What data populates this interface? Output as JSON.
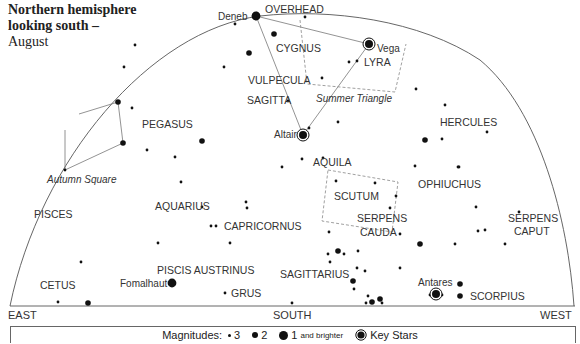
{
  "title": {
    "line1": "Northern hemisphere",
    "line2": "looking south –",
    "line3": "August"
  },
  "horizon": {
    "east": "EAST",
    "south": "SOUTH",
    "west": "WEST"
  },
  "overhead_label": "OVERHEAD",
  "constellations": [
    {
      "name": "CYGNUS",
      "x": 276,
      "y": 52
    },
    {
      "name": "LYRA",
      "x": 364,
      "y": 66
    },
    {
      "name": "VULPECULA",
      "x": 248,
      "y": 84
    },
    {
      "name": "SAGITTA",
      "x": 247,
      "y": 104
    },
    {
      "name": "PEGASUS",
      "x": 142,
      "y": 128
    },
    {
      "name": "HERCULES",
      "x": 440,
      "y": 126
    },
    {
      "name": "AQUILA",
      "x": 313,
      "y": 166
    },
    {
      "name": "OPHIUCHUS",
      "x": 418,
      "y": 188
    },
    {
      "name": "SCUTUM",
      "x": 334,
      "y": 200
    },
    {
      "name": "AQUARIUS",
      "x": 155,
      "y": 210
    },
    {
      "name": "SERPENS",
      "x": 357,
      "y": 222
    },
    {
      "name": "CAUDA",
      "x": 360,
      "y": 236
    },
    {
      "name": "SERPENS",
      "x": 508,
      "y": 222
    },
    {
      "name": "CAPUT",
      "x": 514,
      "y": 235
    },
    {
      "name": "PISCES",
      "x": 34,
      "y": 218
    },
    {
      "name": "CAPRICORNUS",
      "x": 224,
      "y": 230
    },
    {
      "name": "SAGITTARIUS",
      "x": 280,
      "y": 278
    },
    {
      "name": "PISCIS AUSTRINUS",
      "x": 157,
      "y": 274
    },
    {
      "name": "CETUS",
      "x": 40,
      "y": 289
    },
    {
      "name": "GRUS",
      "x": 231,
      "y": 297
    },
    {
      "name": "SCORPIUS",
      "x": 470,
      "y": 300
    }
  ],
  "asterisms": [
    {
      "name": "Summer Triangle",
      "x": 316,
      "y": 102
    },
    {
      "name": "Autumn Square",
      "x": 47,
      "y": 183
    }
  ],
  "key_stars": [
    {
      "name": "Deneb",
      "x": 256,
      "y": 16,
      "label_x": 218,
      "label_y": 20
    },
    {
      "name": "Vega",
      "x": 369,
      "y": 44,
      "label_x": 377,
      "label_y": 52
    },
    {
      "name": "Altair",
      "x": 303,
      "y": 135,
      "label_x": 274,
      "label_y": 138
    },
    {
      "name": "Antares",
      "x": 436,
      "y": 294,
      "label_x": 418,
      "label_y": 286
    },
    {
      "name": "Fomalhaut",
      "x": 172,
      "y": 283,
      "label_x": 120,
      "label_y": 287
    }
  ],
  "stars": [
    {
      "x": 256,
      "y": 16,
      "m": 1
    },
    {
      "x": 235,
      "y": 24,
      "m": 3
    },
    {
      "x": 305,
      "y": 17,
      "m": 3
    },
    {
      "x": 274,
      "y": 34,
      "m": 2
    },
    {
      "x": 249,
      "y": 53,
      "m": 2
    },
    {
      "x": 224,
      "y": 67,
      "m": 3
    },
    {
      "x": 349,
      "y": 62,
      "m": 3
    },
    {
      "x": 357,
      "y": 61,
      "m": 3
    },
    {
      "x": 322,
      "y": 78,
      "m": 3
    },
    {
      "x": 416,
      "y": 89,
      "m": 3
    },
    {
      "x": 288,
      "y": 101,
      "m": 3
    },
    {
      "x": 309,
      "y": 128,
      "m": 3
    },
    {
      "x": 338,
      "y": 122,
      "m": 3
    },
    {
      "x": 135,
      "y": 45,
      "m": 3
    },
    {
      "x": 124,
      "y": 67,
      "m": 3
    },
    {
      "x": 118,
      "y": 102,
      "m": 2
    },
    {
      "x": 132,
      "y": 108,
      "m": 3
    },
    {
      "x": 123,
      "y": 143,
      "m": 2
    },
    {
      "x": 147,
      "y": 150,
      "m": 3
    },
    {
      "x": 175,
      "y": 157,
      "m": 3
    },
    {
      "x": 65,
      "y": 170,
      "m": 3
    },
    {
      "x": 202,
      "y": 141,
      "m": 2
    },
    {
      "x": 181,
      "y": 182,
      "m": 3
    },
    {
      "x": 202,
      "y": 207,
      "m": 3
    },
    {
      "x": 216,
      "y": 226,
      "m": 3
    },
    {
      "x": 211,
      "y": 226,
      "m": 3
    },
    {
      "x": 158,
      "y": 243,
      "m": 3
    },
    {
      "x": 230,
      "y": 243,
      "m": 3
    },
    {
      "x": 81,
      "y": 262,
      "m": 3
    },
    {
      "x": 225,
      "y": 293,
      "m": 3
    },
    {
      "x": 58,
      "y": 302,
      "m": 3
    },
    {
      "x": 88,
      "y": 303,
      "m": 2
    },
    {
      "x": 292,
      "y": 303,
      "m": 3
    },
    {
      "x": 323,
      "y": 158,
      "m": 3
    },
    {
      "x": 302,
      "y": 159,
      "m": 3
    },
    {
      "x": 282,
      "y": 167,
      "m": 3
    },
    {
      "x": 246,
      "y": 202,
      "m": 3
    },
    {
      "x": 247,
      "y": 208,
      "m": 3
    },
    {
      "x": 336,
      "y": 181,
      "m": 3
    },
    {
      "x": 375,
      "y": 183,
      "m": 3
    },
    {
      "x": 390,
      "y": 208,
      "m": 3
    },
    {
      "x": 396,
      "y": 196,
      "m": 3
    },
    {
      "x": 415,
      "y": 166,
      "m": 3
    },
    {
      "x": 459,
      "y": 167,
      "m": 3
    },
    {
      "x": 445,
      "y": 105,
      "m": 3
    },
    {
      "x": 442,
      "y": 139,
      "m": 3
    },
    {
      "x": 487,
      "y": 132,
      "m": 3
    },
    {
      "x": 425,
      "y": 140,
      "m": 2
    },
    {
      "x": 458,
      "y": 167,
      "m": 3
    },
    {
      "x": 476,
      "y": 207,
      "m": 3
    },
    {
      "x": 519,
      "y": 212,
      "m": 3
    },
    {
      "x": 478,
      "y": 231,
      "m": 3
    },
    {
      "x": 485,
      "y": 230,
      "m": 3
    },
    {
      "x": 455,
      "y": 244,
      "m": 3
    },
    {
      "x": 505,
      "y": 244,
      "m": 3
    },
    {
      "x": 420,
      "y": 244,
      "m": 2
    },
    {
      "x": 400,
      "y": 234,
      "m": 3
    },
    {
      "x": 329,
      "y": 232,
      "m": 3
    },
    {
      "x": 338,
      "y": 251,
      "m": 2
    },
    {
      "x": 328,
      "y": 254,
      "m": 3
    },
    {
      "x": 344,
      "y": 254,
      "m": 3
    },
    {
      "x": 358,
      "y": 251,
      "m": 3
    },
    {
      "x": 330,
      "y": 262,
      "m": 3
    },
    {
      "x": 357,
      "y": 268,
      "m": 3
    },
    {
      "x": 365,
      "y": 271,
      "m": 3
    },
    {
      "x": 400,
      "y": 268,
      "m": 3
    },
    {
      "x": 353,
      "y": 281,
      "m": 2
    },
    {
      "x": 354,
      "y": 289,
      "m": 3
    },
    {
      "x": 368,
      "y": 296,
      "m": 3
    },
    {
      "x": 372,
      "y": 302,
      "m": 2
    },
    {
      "x": 380,
      "y": 299,
      "m": 2
    },
    {
      "x": 382,
      "y": 303,
      "m": 3
    },
    {
      "x": 366,
      "y": 303,
      "m": 3
    },
    {
      "x": 460,
      "y": 284,
      "m": 2
    },
    {
      "x": 460,
      "y": 296,
      "m": 2
    },
    {
      "x": 430,
      "y": 295,
      "m": 3
    },
    {
      "x": 442,
      "y": 295,
      "m": 3
    }
  ],
  "legend": {
    "label": "Magnitudes:",
    "mag3": "3",
    "mag2": "2",
    "mag1": "1",
    "mag1_suffix": "and brighter",
    "key": "Key Stars"
  },
  "colors": {
    "ink": "#111111",
    "line": "#777777",
    "text": "#333333"
  }
}
